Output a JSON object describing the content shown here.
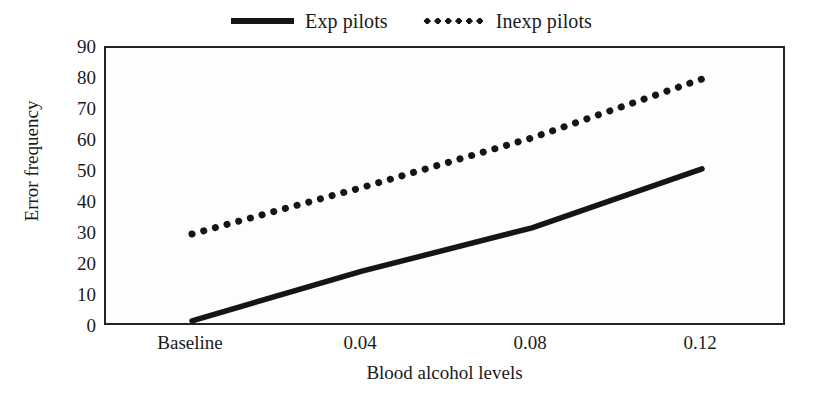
{
  "chart_data": {
    "type": "line",
    "title": "",
    "xlabel": "Blood alcohol levels",
    "ylabel": "Error frequency",
    "categories": [
      "Baseline",
      "0.04",
      "0.08",
      "0.12"
    ],
    "series": [
      {
        "name": "Exp pilots",
        "style": "solid",
        "color": "#151515",
        "values": [
          2,
          18,
          32,
          51
        ]
      },
      {
        "name": "Inexp pilots",
        "style": "dotted",
        "color": "#151515",
        "values": [
          30,
          45,
          61,
          80
        ]
      }
    ],
    "ylim": [
      0,
      90
    ],
    "ytick_labels": [
      "90",
      "80",
      "70",
      "60",
      "50",
      "40",
      "30",
      "20",
      "10",
      "0"
    ],
    "ytick_values": [
      90,
      80,
      70,
      60,
      50,
      40,
      30,
      20,
      10,
      0
    ],
    "grid": false,
    "legend_position": "top-center",
    "plot_background": "#fdfdfd",
    "frame_color": "#242424"
  },
  "legend": {
    "entries": [
      {
        "label": "Exp pilots",
        "swatch": "solid-line-swatch"
      },
      {
        "label": "Inexp pilots",
        "swatch": "dotted-line-swatch"
      }
    ]
  },
  "axes": {
    "y_title": "Error frequency",
    "x_title": "Blood alcohol levels"
  }
}
